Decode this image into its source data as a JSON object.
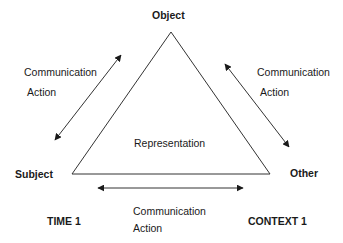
{
  "diagram": {
    "nodes": {
      "object": "Object",
      "subject": "Subject",
      "other": "Other"
    },
    "center_label": "Representation",
    "left_edge": {
      "line1": "Communication",
      "line2": "Action"
    },
    "right_edge": {
      "line1": "Communication",
      "line2": "Action"
    },
    "bottom_edge": {
      "line1": "Communication",
      "line2": "Action"
    },
    "corner_labels": {
      "bottom_left": "TIME 1",
      "bottom_right": "CONTEXT 1"
    },
    "colors": {
      "line": "#333333",
      "text": "#1a1a1a",
      "background": "#ffffff"
    }
  }
}
